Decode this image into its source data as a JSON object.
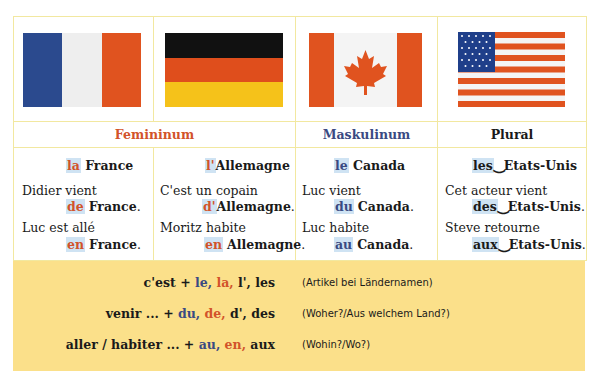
{
  "flags": [
    {
      "country": "France",
      "colors": [
        "#2b4a8e",
        "#f2f2f2",
        "#e0531f"
      ],
      "layout": "vertical"
    },
    {
      "country": "Germany",
      "colors": [
        "#111111",
        "#df4e1c",
        "#f5c21a"
      ],
      "layout": "horizontal"
    },
    {
      "country": "Canada",
      "colors": [
        "#e0531f",
        "#f4f4f4",
        "#e0531f"
      ],
      "layout": "vertical-leaf"
    },
    {
      "country": "USA",
      "colors": [
        "#e0531f",
        "#f4f4f4",
        "#1f3f8a"
      ],
      "layout": "stars-stripes"
    }
  ],
  "headers": {
    "feminine": "Femininum",
    "masculine": "Maskulinum",
    "plural": "Plural"
  },
  "columns": [
    {
      "title_article": "la",
      "title_country": "France",
      "examples": [
        {
          "lead": "Didier vient",
          "prep": "de",
          "country": "France",
          "end": "."
        },
        {
          "lead": "Luc est allé",
          "prep": "en",
          "country": "France",
          "end": "."
        }
      ]
    },
    {
      "title_article": "l'",
      "title_country": "Allemagne",
      "examples": [
        {
          "lead": "C'est un copain",
          "prep": "d'",
          "country": "Allemagne",
          "end": "."
        },
        {
          "lead": "Moritz habite",
          "prep": "en",
          "country": "Allemagne",
          "end": "."
        }
      ]
    },
    {
      "title_article": "le",
      "title_country": "Canada",
      "examples": [
        {
          "lead": "Luc vient",
          "prep": "du",
          "country": "Canada",
          "end": "."
        },
        {
          "lead": "Luc habite",
          "prep": "au",
          "country": "Canada",
          "end": "."
        }
      ]
    },
    {
      "title_article": "les",
      "title_country": "‿Etats-Unis",
      "examples": [
        {
          "lead": "Cet acteur vient",
          "prep": "des",
          "country": "‿Etats-Unis",
          "end": "."
        },
        {
          "lead": "Steve retourne",
          "prep": "aux",
          "country": "‿Etats-Unis",
          "end": "."
        }
      ]
    }
  ],
  "rules": [
    {
      "lead": "c'est +",
      "masc": "le,",
      "fem": "la,",
      "rest": "l', les",
      "note": "(Artikel bei Ländernamen)"
    },
    {
      "lead": "venir ... +",
      "masc": "du,",
      "fem": "de,",
      "rest": "d', des",
      "note": "(Woher?/Aus welchem Land?)"
    },
    {
      "lead": "aller / habiter ... +",
      "masc": "au,",
      "fem": "en,",
      "rest": "aux",
      "note": "(Wohin?/Wo?)"
    }
  ],
  "colors": {
    "feminine": "#d2532a",
    "masculine": "#3a4a82",
    "highlight": "#cfe3f3",
    "summary_bg": "#fbe08a",
    "grid": "#f2e8a0"
  }
}
